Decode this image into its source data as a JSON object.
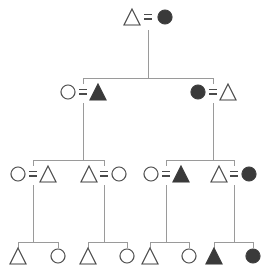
{
  "figure": {
    "kind": "pedigree-chart",
    "width": 270,
    "height": 273,
    "background_color": "#ffffff",
    "line_color": "#9a9a9a",
    "symbol_stroke_color": "#4a4a4a",
    "affected_fill_color": "#3a3a3a",
    "unaffected_fill_color": "#ffffff",
    "mating_symbol": "=",
    "mating_symbol_color": "#4a4a4a",
    "symbol_legend": {
      "triangle": "male",
      "circle": "female",
      "filled": "affected",
      "open": "unaffected"
    }
  },
  "chart_data": {
    "type": "diagram",
    "title": "",
    "generations": [
      {
        "id": "I",
        "y": 17,
        "individuals": [
          {
            "id": "I-1",
            "shape": "triangle",
            "fill": "open",
            "sex": "male",
            "status": "unaffected",
            "x": 132
          },
          {
            "id": "I-2",
            "shape": "circle",
            "fill": "filled",
            "sex": "female",
            "status": "affected",
            "x": 165
          }
        ],
        "matings": [
          {
            "left": "I-1",
            "right": "I-2",
            "symbol_x": 148
          }
        ]
      },
      {
        "id": "II",
        "y": 92,
        "individuals": [
          {
            "id": "II-1",
            "shape": "circle",
            "fill": "open",
            "sex": "female",
            "status": "unaffected",
            "x": 68
          },
          {
            "id": "II-2",
            "shape": "triangle",
            "fill": "filled",
            "sex": "male",
            "status": "affected",
            "x": 98
          },
          {
            "id": "II-3",
            "shape": "circle",
            "fill": "filled",
            "sex": "female",
            "status": "affected",
            "x": 198
          },
          {
            "id": "II-4",
            "shape": "triangle",
            "fill": "open",
            "sex": "male",
            "status": "unaffected",
            "x": 228
          }
        ],
        "matings": [
          {
            "left": "II-1",
            "right": "II-2",
            "symbol_x": 83
          },
          {
            "left": "II-3",
            "right": "II-4",
            "symbol_x": 213
          }
        ]
      },
      {
        "id": "III",
        "y": 174,
        "individuals": [
          {
            "id": "III-1",
            "shape": "circle",
            "fill": "open",
            "sex": "female",
            "status": "unaffected",
            "x": 18
          },
          {
            "id": "III-2",
            "shape": "triangle",
            "fill": "open",
            "sex": "male",
            "status": "unaffected",
            "x": 48
          },
          {
            "id": "III-3",
            "shape": "triangle",
            "fill": "open",
            "sex": "male",
            "status": "unaffected",
            "x": 89
          },
          {
            "id": "III-4",
            "shape": "circle",
            "fill": "open",
            "sex": "female",
            "status": "unaffected",
            "x": 119
          },
          {
            "id": "III-5",
            "shape": "circle",
            "fill": "open",
            "sex": "female",
            "status": "unaffected",
            "x": 151
          },
          {
            "id": "III-6",
            "shape": "triangle",
            "fill": "filled",
            "sex": "male",
            "status": "affected",
            "x": 181
          },
          {
            "id": "III-7",
            "shape": "triangle",
            "fill": "open",
            "sex": "male",
            "status": "unaffected",
            "x": 219
          },
          {
            "id": "III-8",
            "shape": "circle",
            "fill": "filled",
            "sex": "female",
            "status": "affected",
            "x": 249
          }
        ],
        "matings": [
          {
            "left": "III-1",
            "right": "III-2",
            "symbol_x": 33
          },
          {
            "left": "III-3",
            "right": "III-4",
            "symbol_x": 104
          },
          {
            "left": "III-5",
            "right": "III-6",
            "symbol_x": 166
          },
          {
            "left": "III-7",
            "right": "III-8",
            "symbol_x": 234
          }
        ]
      },
      {
        "id": "IV",
        "y": 256,
        "individuals": [
          {
            "id": "IV-1",
            "shape": "triangle",
            "fill": "open",
            "sex": "male",
            "status": "unaffected",
            "x": 18
          },
          {
            "id": "IV-2",
            "shape": "circle",
            "fill": "open",
            "sex": "female",
            "status": "unaffected",
            "x": 58
          },
          {
            "id": "IV-3",
            "shape": "triangle",
            "fill": "open",
            "sex": "male",
            "status": "unaffected",
            "x": 88
          },
          {
            "id": "IV-4",
            "shape": "circle",
            "fill": "open",
            "sex": "female",
            "status": "unaffected",
            "x": 127
          },
          {
            "id": "IV-5",
            "shape": "triangle",
            "fill": "open",
            "sex": "male",
            "status": "unaffected",
            "x": 150
          },
          {
            "id": "IV-6",
            "shape": "circle",
            "fill": "open",
            "sex": "female",
            "status": "unaffected",
            "x": 189
          },
          {
            "id": "IV-7",
            "shape": "triangle",
            "fill": "filled",
            "sex": "male",
            "status": "affected",
            "x": 214
          },
          {
            "id": "IV-8",
            "shape": "circle",
            "fill": "filled",
            "sex": "female",
            "status": "affected",
            "x": 253
          }
        ],
        "matings": []
      }
    ],
    "descent_links": [
      {
        "from_mating": "I-1xI-2",
        "drop_x": 148,
        "drop_y0": 30,
        "drop_y1": 78,
        "sibship_bar_y": 78,
        "children_x": [
          83,
          213
        ]
      },
      {
        "from_mating": "II-1xII-2",
        "drop_x": 83,
        "drop_y0": 103,
        "drop_y1": 160,
        "sibship_bar_y": 160,
        "children_x": [
          33,
          104
        ]
      },
      {
        "from_mating": "II-3xII-4",
        "drop_x": 213,
        "drop_y0": 103,
        "drop_y1": 160,
        "sibship_bar_y": 160,
        "children_x": [
          166,
          234
        ]
      },
      {
        "from_mating": "III-1xIII-2",
        "drop_x": 33,
        "drop_y0": 185,
        "drop_y1": 242,
        "sibship_bar_y": 242,
        "children_x": [
          18,
          58
        ]
      },
      {
        "from_mating": "III-3xIII-4",
        "drop_x": 104,
        "drop_y0": 185,
        "drop_y1": 242,
        "sibship_bar_y": 242,
        "children_x": [
          88,
          127
        ]
      },
      {
        "from_mating": "III-5xIII-6",
        "drop_x": 166,
        "drop_y0": 185,
        "drop_y1": 242,
        "sibship_bar_y": 242,
        "children_x": [
          150,
          189
        ]
      },
      {
        "from_mating": "III-7xIII-8",
        "drop_x": 234,
        "drop_y0": 185,
        "drop_y1": 242,
        "sibship_bar_y": 242,
        "children_x": [
          214,
          253
        ]
      }
    ],
    "counts": {
      "total_individuals": 22,
      "affected_individuals": 7,
      "generation_count": 4
    }
  }
}
